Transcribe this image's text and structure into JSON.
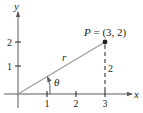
{
  "diagram": {
    "type": "coordinate-plane",
    "axes": {
      "x_label": "x",
      "y_label": "y",
      "x_ticks": [
        "1",
        "2",
        "3"
      ],
      "y_ticks": [
        "1",
        "2"
      ]
    },
    "point": {
      "label": "P = (3, 2)",
      "x": 3,
      "y": 2
    },
    "segment_label": "r",
    "angle_label": "θ",
    "vertical_side_label": "2",
    "colors": {
      "axis": "#231f20",
      "radius_line": "#9a9a9a",
      "point": "#231f20"
    }
  }
}
